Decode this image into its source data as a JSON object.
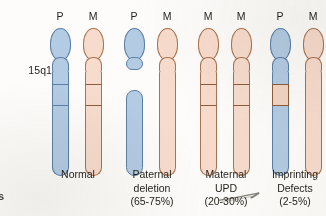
{
  "figure": {
    "locus_label": "15q13",
    "edge_glyph": "s",
    "colors": {
      "paternal_fill": "#b3cbe3",
      "paternal_outline": "#5b7fa6",
      "maternal_fill": "#f7dccd",
      "maternal_outline": "#a9744f",
      "band_outline_maternal": "#8d5c3c",
      "background": "#fdfcfa",
      "text": "#231f1a"
    },
    "panels": [
      {
        "id": "normal",
        "caption_lines": [
          "Normal"
        ],
        "chromosomes": [
          {
            "parent": "P",
            "origin": "paternal",
            "band": "present",
            "band_fill": "paternal"
          },
          {
            "parent": "M",
            "origin": "maternal",
            "band": "present",
            "band_fill": "maternal"
          }
        ]
      },
      {
        "id": "paternal-deletion",
        "caption_lines": [
          "Paternal",
          "deletion",
          "(65-75%)"
        ],
        "chromosomes": [
          {
            "parent": "P",
            "origin": "paternal",
            "band": "deleted",
            "band_fill": "none"
          },
          {
            "parent": "M",
            "origin": "maternal",
            "band": "absent",
            "band_fill": "none"
          }
        ]
      },
      {
        "id": "maternal-upd",
        "caption_lines": [
          "Maternal",
          "UPD",
          "(20-30%)"
        ],
        "chromosomes": [
          {
            "parent": "M",
            "origin": "maternal",
            "band": "present",
            "band_fill": "maternal"
          },
          {
            "parent": "M",
            "origin": "maternal",
            "band": "present",
            "band_fill": "maternal"
          }
        ]
      },
      {
        "id": "imprinting-defects",
        "caption_lines": [
          "Imprinting",
          "Defects",
          "(2-5%)"
        ],
        "chromosomes": [
          {
            "parent": "P",
            "origin": "paternal",
            "band": "present",
            "band_fill": "maternal"
          },
          {
            "parent": "M",
            "origin": "maternal",
            "band": "absent",
            "band_fill": "none"
          }
        ]
      }
    ]
  }
}
